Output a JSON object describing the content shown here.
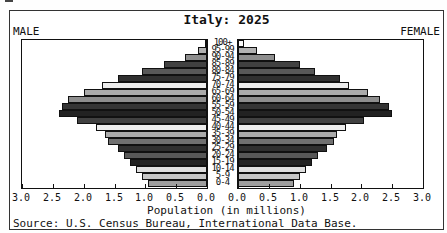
{
  "window": {
    "male_side_label": "MALE",
    "female_side_label": "FEMALE"
  },
  "chart_data": {
    "type": "bar",
    "subtype": "population-pyramid",
    "title": "Italy: 2025",
    "xlabel": "Population (in millions)",
    "source": "Source: U.S. Census Bureau, International Data Base.",
    "categories_top_to_bottom": [
      "100+",
      "95-99",
      "90-94",
      "85-89",
      "80-84",
      "75-79",
      "70-74",
      "65-69",
      "60-64",
      "55-59",
      "50-54",
      "45-49",
      "40-44",
      "35-39",
      "30-34",
      "25-29",
      "20-24",
      "15-19",
      "10-14",
      "5-9",
      "0-4"
    ],
    "series": [
      {
        "name": "Male",
        "side": "left",
        "values": [
          0.02,
          0.15,
          0.35,
          0.7,
          1.05,
          1.45,
          1.7,
          2.0,
          2.25,
          2.35,
          2.4,
          2.1,
          1.8,
          1.65,
          1.6,
          1.45,
          1.35,
          1.25,
          1.15,
          1.05,
          0.95
        ]
      },
      {
        "name": "Female",
        "side": "right",
        "values": [
          0.1,
          0.3,
          0.6,
          1.0,
          1.25,
          1.65,
          1.8,
          2.1,
          2.3,
          2.45,
          2.5,
          2.05,
          1.75,
          1.6,
          1.55,
          1.45,
          1.3,
          1.2,
          1.1,
          1.0,
          0.9
        ]
      }
    ],
    "axis": {
      "xlim_each_side": [
        0,
        3
      ],
      "tick_step": 0.5,
      "male_tick_labels": [
        "3.0",
        "2.5",
        "2.0",
        "1.5",
        "1.0",
        "0.5",
        "0.0"
      ],
      "female_tick_labels": [
        "0.0",
        "0.5",
        "1.0",
        "1.5",
        "2.0",
        "2.5",
        "3.0"
      ],
      "grid": false
    },
    "bar_colors_top_to_bottom": [
      "#fbfbfb",
      "#b2b2b2",
      "#8e8e8e",
      "#414141",
      "#585858",
      "#303030",
      "#ededed",
      "#aaaaaa",
      "#8e8e8e",
      "#353535",
      "#222222",
      "#414141",
      "#ededed",
      "#aaaaaa",
      "#707070",
      "#303030",
      "#585858",
      "#222222",
      "#dedede",
      "#c6c6c6",
      "#9e9e9e"
    ],
    "style": {
      "bar_outline_color": "#111111",
      "frame_color": "#333333",
      "background_color": "#ffffff"
    }
  }
}
